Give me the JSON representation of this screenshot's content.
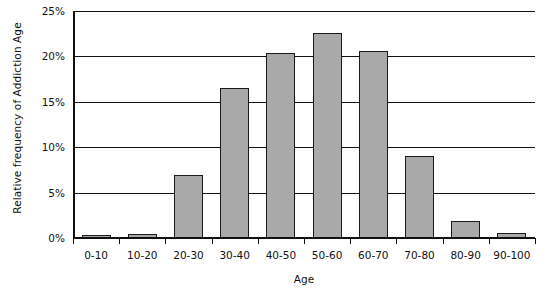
{
  "chart_data": {
    "type": "bar",
    "title": "",
    "xlabel": "Age",
    "ylabel": "Relative frequency of Addiction Age",
    "categories": [
      "0-10",
      "10-20",
      "20-30",
      "30-40",
      "40-50",
      "50-60",
      "60-70",
      "70-80",
      "80-90",
      "90-100"
    ],
    "values": [
      0.2,
      0.4,
      6.9,
      16.5,
      20.4,
      22.6,
      20.6,
      9.0,
      1.9,
      0.5
    ],
    "ylim": [
      0,
      25
    ],
    "ytick_values": [
      0,
      5,
      10,
      15,
      20,
      25
    ],
    "ytick_labels": [
      "0%",
      "5%",
      "10%",
      "15%",
      "20%",
      "25%"
    ],
    "grid": true,
    "legend": "none",
    "bar_fill_color": "#a9a9a9",
    "bar_edge_color": "#1a1a1a",
    "axis_color": "#101010",
    "background_color": "#ffffff"
  }
}
